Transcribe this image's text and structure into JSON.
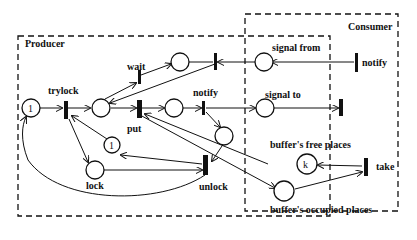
{
  "groups": {
    "producer": "Producer",
    "consumer": "Consumer"
  },
  "transitions": {
    "trylock": "trylock",
    "wait": "wait",
    "put": "put",
    "notify_producer": "notify",
    "unlock": "unlock",
    "notify_consumer": "notify",
    "take": "take"
  },
  "places": {
    "start_token": "1",
    "lock_token": "1",
    "lock": "lock",
    "signal_from": "signal from",
    "signal_to": "signal to",
    "buffer_free_token": "k",
    "buffer_free": "buffer's free places",
    "buffer_occupied": "buffer's occupied places"
  }
}
